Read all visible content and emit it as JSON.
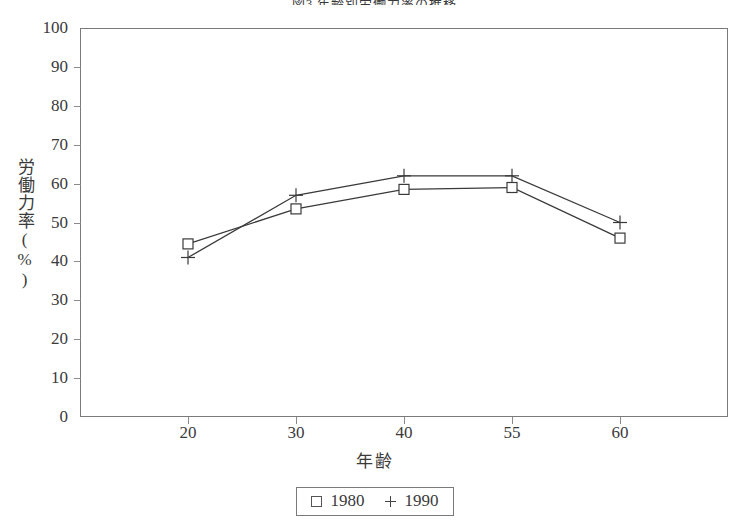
{
  "chart_data": {
    "type": "line",
    "title": "図3 年齢別労働力率の推移",
    "xlabel": "年齢",
    "ylabel": "労働力率(%)",
    "categories": [
      "20",
      "30",
      "40",
      "55",
      "60"
    ],
    "series": [
      {
        "name": "1980",
        "marker": "square",
        "values": [
          44.5,
          53.5,
          58.5,
          59.0,
          46.0
        ]
      },
      {
        "name": "1990",
        "marker": "plus",
        "values": [
          41.0,
          57.0,
          62.0,
          62.0,
          50.0
        ]
      }
    ],
    "ylim": [
      0,
      100
    ],
    "y_ticks": [
      "0",
      "10",
      "20",
      "30",
      "40",
      "50",
      "60",
      "70",
      "80",
      "90",
      "100"
    ],
    "grid": false,
    "legend_position": "bottom-center",
    "line_color": "#3a3a3a",
    "axis_color": "#7a7a7a"
  },
  "legend": {
    "entries": [
      {
        "label": "1980",
        "marker_name": "square-marker-icon"
      },
      {
        "label": "1990",
        "marker_name": "plus-marker-icon"
      }
    ]
  }
}
